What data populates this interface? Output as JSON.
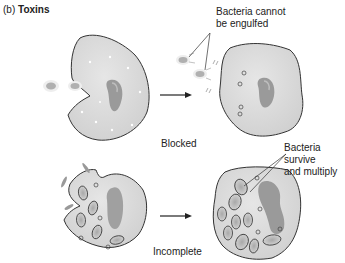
{
  "figure": {
    "panel_letter": "(b)",
    "panel_title": "Toxins"
  },
  "rows": [
    {
      "name": "blocked",
      "caption": "Blocked",
      "annotation": [
        "Bacteria cannot",
        "be engulfed"
      ]
    },
    {
      "name": "incomplete",
      "caption": "Incomplete",
      "annotation": [
        "Bacteria",
        "survive",
        "and multiply"
      ]
    }
  ],
  "colors": {
    "cell_fill": "#d9d9d9",
    "cell_outline": "#333333",
    "nucleus": "#9a9a9a",
    "bacteria": "#b5b5b5",
    "text": "#222222"
  }
}
